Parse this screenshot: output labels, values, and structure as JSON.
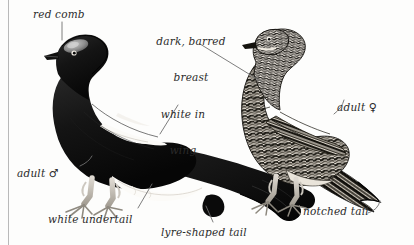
{
  "plate": {
    "subject": "Black Grouse",
    "background_color": "#fdfdfc",
    "ink_color": "#1a1a1a",
    "label_color": "#2b2b2b",
    "leader_line_color": "#6b6b6b",
    "width": 414,
    "height": 245
  },
  "labels": {
    "red_comb": "red comb",
    "dark_barred_breast_line1": "dark, barred",
    "dark_barred_breast_line2": "breast",
    "white_in_wing_line1": "white in",
    "white_in_wing_line2": "wing",
    "adult_male_text": "adult ",
    "adult_male_symbol": "♂",
    "adult_female_text": "adult ",
    "adult_female_symbol": "♀",
    "white_undertail": "white undertail",
    "lyre_shaped_tail": "lyre-shaped tail",
    "notched_tail": "notched tail"
  },
  "figures": {
    "male": {
      "name": "adult male black grouse",
      "plumage": "glossy black",
      "features": [
        "red comb",
        "white in wing",
        "white undertail",
        "lyre-shaped tail"
      ]
    },
    "female": {
      "name": "adult female black grouse",
      "plumage": "dark barred brown",
      "features": [
        "dark, barred breast",
        "notched tail"
      ]
    }
  }
}
